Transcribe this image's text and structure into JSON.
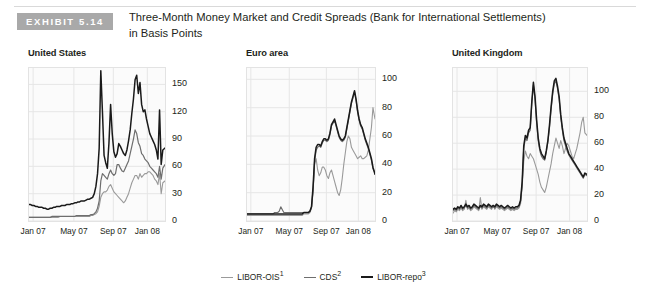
{
  "exhibit": {
    "badge": "EXHIBIT 5.14",
    "title_line1": "Three-Month Money Market and Credit Spreads (Bank for International Settlements)",
    "title_line2": "in Basis Points"
  },
  "legend": {
    "items": [
      {
        "label": "LIBOR-OIS",
        "note": "1",
        "color": "#9a9a9a"
      },
      {
        "label": "CDS",
        "note": "2",
        "color": "#6e6e6e"
      },
      {
        "label": "LIBOR-repo",
        "note": "3",
        "color": "#1a1a1a"
      }
    ]
  },
  "chart_data": [
    {
      "type": "line",
      "title": "United States",
      "xlabel": "",
      "ylabel": "",
      "grid": true,
      "legend_position": "bottom-shared",
      "y_axis_side": "right",
      "ylim": [
        0,
        168
      ],
      "yticks": [
        0,
        30,
        60,
        90,
        120,
        150
      ],
      "xticks": [
        "Jan 07",
        "May 07",
        "Sep 07",
        "Jan 08"
      ],
      "xtick_positions": [
        0.03,
        0.33,
        0.62,
        0.87
      ],
      "x": [
        0,
        0.012,
        0.024,
        0.036,
        0.048,
        0.06,
        0.072,
        0.084,
        0.096,
        0.108,
        0.12,
        0.132,
        0.144,
        0.156,
        0.168,
        0.18,
        0.192,
        0.204,
        0.216,
        0.228,
        0.24,
        0.252,
        0.264,
        0.276,
        0.288,
        0.3,
        0.312,
        0.324,
        0.336,
        0.348,
        0.36,
        0.372,
        0.384,
        0.396,
        0.408,
        0.42,
        0.432,
        0.444,
        0.456,
        0.468,
        0.48,
        0.492,
        0.504,
        0.516,
        0.528,
        0.54,
        0.552,
        0.564,
        0.576,
        0.588,
        0.6,
        0.612,
        0.624,
        0.636,
        0.648,
        0.66,
        0.672,
        0.684,
        0.696,
        0.708,
        0.72,
        0.732,
        0.744,
        0.756,
        0.768,
        0.78,
        0.792,
        0.804,
        0.816,
        0.828,
        0.84,
        0.852,
        0.864,
        0.876,
        0.888,
        0.9,
        0.912,
        0.924,
        0.936,
        0.948,
        0.96,
        0.972,
        0.984,
        1.0
      ],
      "series": [
        {
          "name": "LIBOR-repo",
          "color": "#1a1a1a",
          "width": 1.5,
          "values": [
            18,
            18,
            17,
            17,
            16,
            16,
            15,
            15,
            15,
            14,
            14,
            13,
            13,
            14,
            14,
            15,
            15,
            16,
            16,
            16,
            17,
            17,
            17,
            18,
            18,
            18,
            19,
            19,
            20,
            20,
            21,
            21,
            22,
            22,
            22,
            23,
            24,
            24,
            25,
            26,
            30,
            38,
            52,
            80,
            165,
            120,
            72,
            64,
            58,
            86,
            128,
            96,
            76,
            70,
            74,
            85,
            82,
            78,
            74,
            72,
            78,
            88,
            100,
            118,
            134,
            155,
            160,
            140,
            152,
            128,
            120,
            122,
            112,
            104,
            96,
            92,
            88,
            84,
            78,
            68,
            122,
            62,
            78,
            80
          ]
        },
        {
          "name": "CDS",
          "color": "#6e6e6e",
          "width": 1.2,
          "values": [
            4,
            4,
            4,
            4,
            4,
            4,
            4,
            4,
            4,
            4,
            4,
            4,
            4,
            4,
            5,
            5,
            5,
            5,
            5,
            5,
            5,
            5,
            5,
            5,
            5,
            5,
            5,
            5,
            5,
            6,
            6,
            6,
            6,
            6,
            6,
            6,
            6,
            6,
            7,
            7,
            8,
            10,
            14,
            22,
            44,
            52,
            50,
            48,
            46,
            52,
            56,
            52,
            50,
            52,
            62,
            62,
            58,
            55,
            54,
            58,
            62,
            66,
            74,
            82,
            90,
            100,
            96,
            86,
            82,
            74,
            72,
            68,
            66,
            64,
            60,
            58,
            56,
            54,
            52,
            48,
            60,
            46,
            58,
            62
          ]
        },
        {
          "name": "LIBOR-OIS",
          "color": "#9a9a9a",
          "width": 1.1,
          "values": [
            4,
            4,
            4,
            4,
            4,
            4,
            4,
            4,
            4,
            4,
            4,
            4,
            4,
            4,
            4,
            4,
            4,
            4,
            4,
            5,
            5,
            5,
            5,
            5,
            5,
            5,
            5,
            5,
            5,
            5,
            5,
            5,
            5,
            5,
            5,
            5,
            5,
            5,
            6,
            6,
            7,
            8,
            10,
            16,
            26,
            30,
            32,
            32,
            34,
            38,
            40,
            36,
            32,
            30,
            28,
            26,
            24,
            22,
            20,
            22,
            26,
            30,
            36,
            42,
            46,
            50,
            50,
            46,
            52,
            48,
            50,
            52,
            52,
            54,
            54,
            52,
            50,
            46,
            44,
            40,
            52,
            30,
            42,
            44
          ]
        }
      ]
    },
    {
      "type": "line",
      "title": "Euro area",
      "xlabel": "",
      "ylabel": "",
      "grid": true,
      "legend_position": "bottom-shared",
      "y_axis_side": "right",
      "ylim": [
        0,
        108
      ],
      "yticks": [
        0,
        20,
        40,
        60,
        80,
        100
      ],
      "xticks": [
        "Jan 07",
        "May 07",
        "Sep 07",
        "Jan 08"
      ],
      "xtick_positions": [
        0.03,
        0.33,
        0.62,
        0.87
      ],
      "x": [
        0,
        0.012,
        0.024,
        0.036,
        0.048,
        0.06,
        0.072,
        0.084,
        0.096,
        0.108,
        0.12,
        0.132,
        0.144,
        0.156,
        0.168,
        0.18,
        0.192,
        0.204,
        0.216,
        0.228,
        0.24,
        0.252,
        0.264,
        0.276,
        0.288,
        0.3,
        0.312,
        0.324,
        0.336,
        0.348,
        0.36,
        0.372,
        0.384,
        0.396,
        0.408,
        0.42,
        0.432,
        0.444,
        0.456,
        0.468,
        0.48,
        0.492,
        0.504,
        0.516,
        0.528,
        0.54,
        0.552,
        0.564,
        0.576,
        0.588,
        0.6,
        0.612,
        0.624,
        0.636,
        0.648,
        0.66,
        0.672,
        0.684,
        0.696,
        0.708,
        0.72,
        0.732,
        0.744,
        0.756,
        0.768,
        0.78,
        0.792,
        0.804,
        0.816,
        0.828,
        0.84,
        0.852,
        0.864,
        0.876,
        0.888,
        0.9,
        0.912,
        0.924,
        0.936,
        0.948,
        0.96,
        0.972,
        0.984,
        1.0
      ],
      "series": [
        {
          "name": "LIBOR-repo",
          "color": "#1a1a1a",
          "width": 1.5,
          "values": [
            5,
            5,
            5,
            5,
            5,
            5,
            5,
            5,
            5,
            5,
            5,
            5,
            5,
            5,
            5,
            5,
            5,
            5,
            5,
            5,
            5,
            5,
            5,
            5,
            5,
            5,
            5,
            5,
            5,
            5,
            5,
            5,
            5,
            5,
            5,
            5,
            5,
            6,
            6,
            6,
            6,
            7,
            10,
            24,
            44,
            52,
            54,
            54,
            53,
            56,
            58,
            58,
            57,
            58,
            62,
            68,
            70,
            72,
            68,
            64,
            60,
            58,
            57,
            58,
            60,
            66,
            72,
            78,
            84,
            88,
            92,
            86,
            78,
            72,
            68,
            66,
            62,
            58,
            55,
            52,
            48,
            44,
            38,
            33
          ]
        },
        {
          "name": "CDS",
          "color": "#6e6e6e",
          "width": 1.2,
          "values": [
            5,
            5,
            5,
            5,
            5,
            5,
            5,
            5,
            5,
            5,
            5,
            5,
            5,
            5,
            5,
            5,
            5,
            5,
            6,
            6,
            6,
            7,
            10,
            8,
            6,
            6,
            6,
            6,
            6,
            6,
            6,
            6,
            6,
            6,
            6,
            6,
            6,
            6,
            6,
            6,
            6,
            7,
            10,
            22,
            42,
            50,
            52,
            53,
            52,
            55,
            57,
            57,
            56,
            57,
            61,
            67,
            69,
            71,
            67,
            63,
            59,
            57,
            56,
            57,
            59,
            65,
            71,
            77,
            83,
            87,
            91,
            85,
            77,
            71,
            67,
            65,
            61,
            57,
            54,
            51,
            47,
            43,
            37,
            34
          ]
        },
        {
          "name": "LIBOR-OIS",
          "color": "#9a9a9a",
          "width": 1.1,
          "values": [
            4,
            4,
            4,
            4,
            4,
            4,
            4,
            4,
            4,
            4,
            4,
            4,
            4,
            4,
            4,
            4,
            4,
            4,
            4,
            4,
            4,
            4,
            4,
            4,
            4,
            4,
            4,
            4,
            4,
            4,
            4,
            4,
            4,
            4,
            4,
            4,
            4,
            5,
            5,
            5,
            5,
            6,
            9,
            20,
            40,
            44,
            36,
            32,
            34,
            38,
            38,
            36,
            32,
            30,
            34,
            36,
            32,
            28,
            24,
            20,
            18,
            22,
            30,
            40,
            48,
            56,
            60,
            58,
            52,
            50,
            48,
            46,
            44,
            45,
            46,
            44,
            44,
            45,
            46,
            50,
            58,
            66,
            80,
            72
          ]
        }
      ]
    },
    {
      "type": "line",
      "title": "United Kingdom",
      "xlabel": "",
      "ylabel": "",
      "grid": true,
      "legend_position": "bottom-shared",
      "y_axis_side": "right",
      "ylim": [
        0,
        118
      ],
      "yticks": [
        0,
        20,
        40,
        60,
        80,
        100
      ],
      "xticks": [
        "Jan 07",
        "May 07",
        "Sep 07",
        "Jan 08"
      ],
      "xtick_positions": [
        0.03,
        0.33,
        0.62,
        0.87
      ],
      "x": [
        0,
        0.012,
        0.024,
        0.036,
        0.048,
        0.06,
        0.072,
        0.084,
        0.096,
        0.108,
        0.12,
        0.132,
        0.144,
        0.156,
        0.168,
        0.18,
        0.192,
        0.204,
        0.216,
        0.228,
        0.24,
        0.252,
        0.264,
        0.276,
        0.288,
        0.3,
        0.312,
        0.324,
        0.336,
        0.348,
        0.36,
        0.372,
        0.384,
        0.396,
        0.408,
        0.42,
        0.432,
        0.444,
        0.456,
        0.468,
        0.48,
        0.492,
        0.504,
        0.516,
        0.528,
        0.54,
        0.552,
        0.564,
        0.576,
        0.588,
        0.6,
        0.612,
        0.624,
        0.636,
        0.648,
        0.66,
        0.672,
        0.684,
        0.696,
        0.708,
        0.72,
        0.732,
        0.744,
        0.756,
        0.768,
        0.78,
        0.792,
        0.804,
        0.816,
        0.828,
        0.84,
        0.852,
        0.864,
        0.876,
        0.888,
        0.9,
        0.912,
        0.924,
        0.936,
        0.948,
        0.96,
        0.972,
        0.984,
        1.0
      ],
      "series": [
        {
          "name": "LIBOR-repo",
          "color": "#1a1a1a",
          "width": 1.5,
          "values": [
            9,
            10,
            9,
            11,
            10,
            12,
            10,
            11,
            13,
            11,
            12,
            10,
            11,
            13,
            12,
            11,
            10,
            12,
            11,
            13,
            12,
            11,
            13,
            12,
            11,
            12,
            11,
            13,
            12,
            11,
            12,
            11,
            10,
            11,
            12,
            11,
            10,
            11,
            10,
            11,
            11,
            12,
            16,
            30,
            58,
            66,
            64,
            70,
            72,
            92,
            107,
            96,
            78,
            64,
            56,
            52,
            50,
            48,
            54,
            62,
            74,
            88,
            100,
            108,
            110,
            104,
            96,
            82,
            72,
            64,
            60,
            56,
            52,
            50,
            48,
            46,
            44,
            42,
            40,
            38,
            36,
            34,
            37,
            36
          ]
        },
        {
          "name": "CDS",
          "color": "#6e6e6e",
          "width": 1.2,
          "values": [
            8,
            9,
            8,
            10,
            9,
            11,
            9,
            10,
            12,
            10,
            11,
            9,
            10,
            12,
            11,
            10,
            9,
            11,
            10,
            12,
            11,
            10,
            12,
            11,
            10,
            11,
            10,
            12,
            11,
            10,
            11,
            10,
            9,
            10,
            11,
            10,
            9,
            10,
            9,
            10,
            10,
            11,
            15,
            28,
            56,
            64,
            62,
            68,
            70,
            90,
            105,
            94,
            76,
            62,
            54,
            50,
            48,
            47,
            53,
            61,
            72,
            86,
            98,
            106,
            108,
            102,
            94,
            80,
            70,
            62,
            58,
            54,
            51,
            49,
            47,
            45,
            43,
            41,
            39,
            37,
            35,
            33,
            36,
            35
          ]
        },
        {
          "name": "LIBOR-OIS",
          "color": "#9a9a9a",
          "width": 1.1,
          "values": [
            6,
            8,
            7,
            9,
            8,
            10,
            8,
            9,
            16,
            9,
            10,
            8,
            9,
            11,
            10,
            9,
            8,
            18,
            9,
            11,
            10,
            9,
            11,
            10,
            9,
            12,
            9,
            11,
            10,
            9,
            10,
            9,
            8,
            9,
            10,
            9,
            8,
            9,
            8,
            9,
            9,
            10,
            13,
            26,
            46,
            54,
            50,
            48,
            52,
            50,
            48,
            44,
            40,
            36,
            30,
            26,
            24,
            22,
            26,
            32,
            38,
            44,
            52,
            58,
            64,
            60,
            56,
            62,
            58,
            52,
            56,
            60,
            58,
            54,
            50,
            48,
            52,
            56,
            62,
            68,
            76,
            80,
            68,
            66
          ]
        }
      ]
    }
  ]
}
